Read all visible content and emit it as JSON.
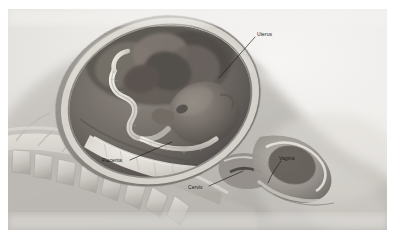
{
  "figure": {
    "kind": "anatomical-photograph",
    "color_mode": "grayscale",
    "background_color": "#ffffff",
    "frame": {
      "left": 8,
      "top": 9,
      "width": 379,
      "height": 221,
      "base_tone": "#e3e2df"
    }
  },
  "annotations": [
    {
      "id": "uterus",
      "label": "Uterus",
      "label_x": 257,
      "label_y": 31,
      "leader": {
        "x1": 255,
        "y1": 37,
        "x2": 219,
        "y2": 78
      },
      "color": "#1c1c1c"
    },
    {
      "id": "placenta",
      "label": "Placenta",
      "label_x": 102,
      "label_y": 157,
      "leader": {
        "x1": 130,
        "y1": 160,
        "x2": 172,
        "y2": 142
      },
      "color": "#1c1c1c"
    },
    {
      "id": "cervix",
      "label": "Cervix",
      "label_x": 188,
      "label_y": 184,
      "leader": {
        "x1": 209,
        "y1": 186,
        "x2": 243,
        "y2": 171
      },
      "color": "#1c1c1c"
    },
    {
      "id": "vagina",
      "label": "Vagina",
      "label_x": 279,
      "label_y": 155,
      "leader": {
        "x1": 281,
        "y1": 161,
        "x2": 268,
        "y2": 182
      },
      "color": "#1c1c1c"
    }
  ],
  "palette": {
    "paper_white": "#ffffff",
    "photo_light": "#eceae7",
    "photo_mid": "#b9b6b1",
    "photo_dark": "#6e6a66",
    "photo_deep": "#3d3a37",
    "leader_line": "#1c1c1c",
    "label_text": "#1c1c1c"
  }
}
